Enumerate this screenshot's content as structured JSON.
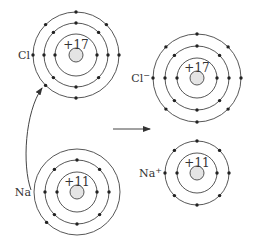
{
  "diagram": {
    "type": "ionic-bond-formation",
    "atoms": [
      {
        "id": "cl",
        "label": "Cl",
        "nucleus_charge": "+17",
        "cx": 76,
        "cy": 55,
        "shells": [
          {
            "r": 21,
            "electrons": 2
          },
          {
            "r": 32,
            "electrons": 8
          },
          {
            "r": 43,
            "electrons": 7
          }
        ]
      },
      {
        "id": "na",
        "label": "Na",
        "nucleus_charge": "+11",
        "cx": 77,
        "cy": 192,
        "shells": [
          {
            "r": 20,
            "electrons": 2
          },
          {
            "r": 32,
            "electrons": 8
          },
          {
            "r": 43,
            "electrons": 1
          }
        ]
      },
      {
        "id": "cl-ion",
        "label": "Cl",
        "label_sup": "−",
        "nucleus_charge": "+17",
        "cx": 197,
        "cy": 78,
        "shells": [
          {
            "r": 20,
            "electrons": 2
          },
          {
            "r": 32,
            "electrons": 8
          },
          {
            "r": 44,
            "electrons": 8
          }
        ]
      },
      {
        "id": "na-ion",
        "label": "Na",
        "label_sup": "+",
        "nucleus_charge": "+11",
        "cx": 197,
        "cy": 173,
        "shells": [
          {
            "r": 20,
            "electrons": 2
          },
          {
            "r": 32,
            "electrons": 8
          }
        ]
      }
    ],
    "arrows": [
      {
        "id": "electron-transfer-arrow",
        "from": "na outer electron",
        "to": "cl outer shell"
      },
      {
        "id": "reaction-arrow",
        "from": "left",
        "to": "right"
      }
    ],
    "colors": {
      "line": "#444444",
      "electron": "#222222",
      "nucleus_fill": "#e4e4e4"
    }
  }
}
